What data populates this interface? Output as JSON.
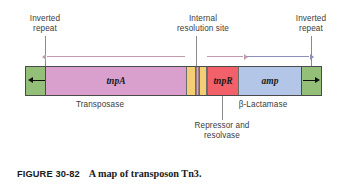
{
  "figure": {
    "number": "FIGURE 30-82",
    "title": "A map of transposon Tn3."
  },
  "callouts": {
    "inverted_repeat_left": "Inverted\nrepeat",
    "internal_resolution_site": "Internal\nresolution site",
    "inverted_repeat_right": "Inverted\nrepeat",
    "transposase": "Transposase",
    "beta_lactamase": "β-Lactamase",
    "repressor_and_resolvase": "Repressor and\nresolvase"
  },
  "map": {
    "segments": [
      {
        "id": "ir-left",
        "label": "",
        "role": "inverted-repeat",
        "color": "#93bf79",
        "x": 0,
        "w": 20
      },
      {
        "id": "tnpA",
        "label": "tnpA",
        "role": "transposase-gene",
        "color": "#d9a0cd",
        "x": 20,
        "w": 140
      },
      {
        "id": "res-left",
        "label": "",
        "role": "internal-resolution-site",
        "color": "#f3ce74",
        "x": 160,
        "w": 10
      },
      {
        "id": "res-mid",
        "label": "",
        "role": "resolution-site-stripe",
        "color": "#d9a0cd",
        "x": 170,
        "w": 3
      },
      {
        "id": "res-right",
        "label": "",
        "role": "internal-resolution-site",
        "color": "#f3ce74",
        "x": 173,
        "w": 8
      },
      {
        "id": "tnpR",
        "label": "tnpR",
        "role": "repressor-resolvase-gene",
        "color": "#f2616a",
        "x": 181,
        "w": 32
      },
      {
        "id": "amp",
        "label": "amp",
        "role": "beta-lactamase-gene",
        "color": "#b3c6e7",
        "x": 213,
        "w": 62
      },
      {
        "id": "ir-right",
        "label": "",
        "role": "inverted-repeat",
        "color": "#93bf79",
        "x": 275,
        "w": 20
      }
    ],
    "transcription_arrows": [
      {
        "id": "tnpA-transcript",
        "direction": "left",
        "color": "#c09aae"
      },
      {
        "id": "tnpR-transcript",
        "direction": "right",
        "color": "#c09aae"
      },
      {
        "id": "amp-transcript",
        "direction": "right",
        "color": "#8e8fb8"
      }
    ],
    "repeat_arrows": [
      {
        "id": "ir-left-arrow",
        "direction": "left"
      },
      {
        "id": "ir-right-arrow",
        "direction": "right"
      }
    ]
  },
  "colors": {
    "inverted_repeat": "#93bf79",
    "tnpA": "#d9a0cd",
    "resolution_site": "#f3ce74",
    "tnpR": "#f2616a",
    "amp": "#b3c6e7",
    "background": "#ffffff",
    "text": "#3b3b3b"
  }
}
